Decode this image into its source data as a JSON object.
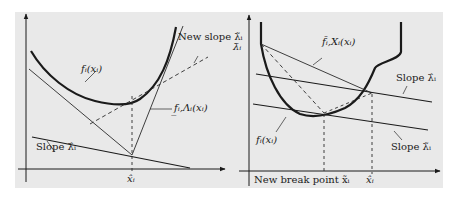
{
  "figure": {
    "left_panel": {
      "labels": {
        "function": "f_i(x_i)",
        "function_display": "fᵢ(xᵢ)",
        "new_slope": "New slope λ̃_i",
        "new_slope_display": "New slope λ̃ᵢ",
        "lower_bound": "f_{i,Λ_i}(x_i)",
        "lower_bound_display": "f̲ᵢ,Λᵢ(xᵢ)",
        "slope": "Slope λ̂_i",
        "slope_display": "Slope λ̂ᵢ",
        "x_tick": "x̂_i",
        "x_tick_display": "x̂ᵢ"
      }
    },
    "right_panel": {
      "labels": {
        "y_tick": "λ̄_i",
        "y_tick_display": "λ̄ᵢ",
        "upper_bound": "f̄_{i,X_i}(x_i)",
        "upper_bound_display": "f̄ᵢ,Xᵢ(xᵢ)",
        "slope_upper": "Slope λ̂_i",
        "slope_upper_display": "Slope λ̂ᵢ",
        "slope_lower": "Slope λ̃_i",
        "slope_lower_display": "Slope λ̃ᵢ",
        "function": "f_i(x_i)",
        "function_display": "fᵢ(xᵢ)",
        "new_break_point": "New break point x̃_i",
        "new_break_point_display": "New break point x̃ᵢ",
        "x_tick": "x̂_i",
        "x_tick_display": "x̂ᵢ"
      }
    },
    "colors": {
      "background": "#e9e9e9",
      "ink": "#1a1a1a",
      "thin_line": "#2a2a2a"
    }
  }
}
